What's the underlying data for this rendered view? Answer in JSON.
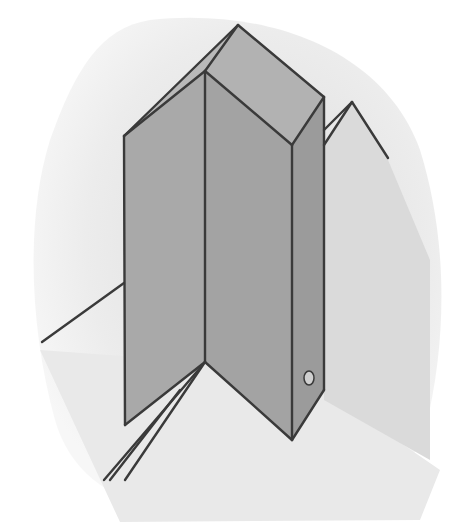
{
  "illustration": {
    "subject": "folded prism / crystal column drawing",
    "width": 455,
    "height": 530,
    "colors": {
      "background": "#ffffff",
      "backdrop_light": "#f3f3f3",
      "backdrop_mid": "#e6e6e6",
      "face_left": "#a9a9a9",
      "face_front": "#a3a3a3",
      "face_right": "#9b9b9b",
      "cap_left": "#b9b9b9",
      "cap_right": "#b2b2b2",
      "rear_prism": "#dadada",
      "floor": "#e9e9e9",
      "stroke": "#3a3a3a",
      "knob": "#cfcfcf"
    },
    "backdrop_path": "M 150 20 C 250 8 380 40 420 150 C 445 230 450 330 425 430 C 400 500 330 520 230 518 C 140 516 75 490 55 420 C 30 330 25 220 50 140 C 75 70 100 28 150 20 Z",
    "floor_polygon": "205,362 292,440 324,390 440,470 420,520 120,522 40,350",
    "rear_prism_polygon": "324,145 352,102 388,160 430,260 430,460 324,400",
    "faces": {
      "cap_left": "124,136 238,25 205,71",
      "cap_front": "124,136 205,71 292,145 205,362 125,425",
      "cap_right": "205,71 238,25 324,97 292,145",
      "face_left": "124,136 205,71 205,362 125,425",
      "face_front": "205,71 292,145 292,440 205,362",
      "face_right": "292,145 324,97 324,390 292,440"
    },
    "lines": [
      {
        "x1": 124,
        "y1": 136,
        "x2": 238,
        "y2": 25
      },
      {
        "x1": 238,
        "y1": 25,
        "x2": 324,
        "y2": 97
      },
      {
        "x1": 124,
        "y1": 136,
        "x2": 205,
        "y2": 71
      },
      {
        "x1": 205,
        "y1": 71,
        "x2": 238,
        "y2": 25
      },
      {
        "x1": 205,
        "y1": 71,
        "x2": 292,
        "y2": 145
      },
      {
        "x1": 292,
        "y1": 145,
        "x2": 324,
        "y2": 97
      },
      {
        "x1": 124,
        "y1": 136,
        "x2": 125,
        "y2": 425
      },
      {
        "x1": 205,
        "y1": 71,
        "x2": 205,
        "y2": 362
      },
      {
        "x1": 292,
        "y1": 145,
        "x2": 292,
        "y2": 440
      },
      {
        "x1": 324,
        "y1": 97,
        "x2": 324,
        "y2": 390
      },
      {
        "x1": 125,
        "y1": 425,
        "x2": 205,
        "y2": 362
      },
      {
        "x1": 205,
        "y1": 362,
        "x2": 292,
        "y2": 440
      },
      {
        "x1": 292,
        "y1": 440,
        "x2": 324,
        "y2": 390
      },
      {
        "x1": 324,
        "y1": 145,
        "x2": 352,
        "y2": 102
      },
      {
        "x1": 324,
        "y1": 130,
        "x2": 352,
        "y2": 102
      },
      {
        "x1": 352,
        "y1": 102,
        "x2": 388,
        "y2": 158
      },
      {
        "x1": 124,
        "y1": 283,
        "x2": 42,
        "y2": 342
      },
      {
        "x1": 205,
        "y1": 362,
        "x2": 125,
        "y2": 480
      },
      {
        "x1": 200,
        "y1": 368,
        "x2": 104,
        "y2": 480
      },
      {
        "x1": 180,
        "y1": 390,
        "x2": 110,
        "y2": 480
      }
    ],
    "knob": {
      "cx": 309,
      "cy": 378,
      "rx": 5,
      "ry": 7
    }
  }
}
